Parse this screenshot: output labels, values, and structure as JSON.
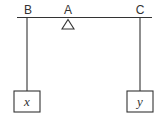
{
  "diagram": {
    "type": "lever-balance",
    "labels": {
      "left_end": "B",
      "fulcrum": "A",
      "right_end": "C"
    },
    "weights": {
      "left": "x",
      "right": "y"
    },
    "colors": {
      "stroke": "#333333",
      "background": "#ffffff"
    }
  }
}
